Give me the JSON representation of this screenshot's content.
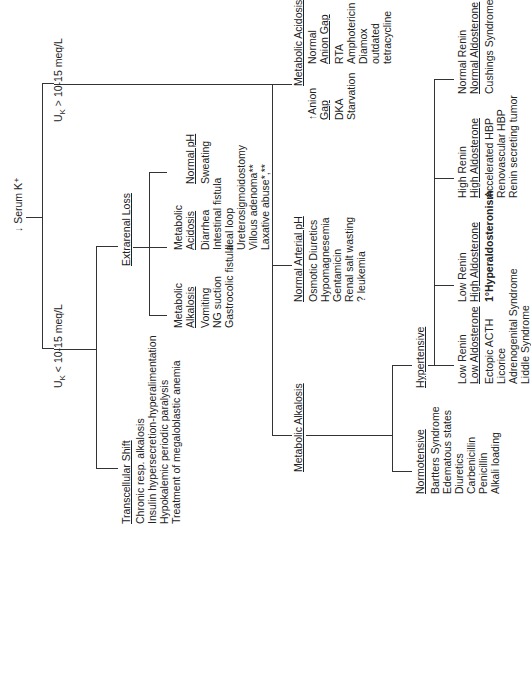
{
  "root": {
    "label": "↓ Serum K⁺"
  },
  "branches": {
    "high": {
      "label_prefix": "U",
      "label_sub": "K",
      "label_rest": " > 10-15 meq/L"
    },
    "low": {
      "label_prefix": "U",
      "label_sub": "K",
      "label_rest": " < 10-15 meq/L"
    }
  },
  "transcellular": {
    "title": "Transcellular Shift",
    "items": [
      "Chronic resp. alkalosis",
      "Insulin hypersecretion-hyperalimentation",
      "Hypokalemic periodic paralysis",
      "Treatment of megaloblastic anemia"
    ]
  },
  "extrarenal": {
    "title": "Extrarenal Loss",
    "alkalosis": {
      "title1": "Metabolic",
      "title2": "Alkalosis",
      "items": [
        "Vomiting",
        "NG suction",
        "Gastrocolic fistula"
      ]
    },
    "acidosis": {
      "title1": "Metabolic",
      "title2": "Acidosis",
      "items": [
        "Diarrhea",
        "Intestinal fistula",
        "Ileal loop",
        "Ureterosigmoidostomy",
        "Villous adenoma**",
        "Laxative abuse*,**"
      ]
    },
    "normal": {
      "title": "Normal pH",
      "items": [
        "Sweating"
      ]
    }
  },
  "renal_acidosis": {
    "title": "Metabolic Acidosis",
    "anion_gap": {
      "title1": "↑Anion",
      "title2": "Gap",
      "items": [
        "DKA",
        "Starvation"
      ]
    },
    "normal_gap": {
      "title1": "Normal",
      "title2": "Anion Gap",
      "items": [
        "RTA",
        "Amphotericin",
        "Diamox",
        "outdated",
        "tetracycline"
      ]
    }
  },
  "renal_normal": {
    "title": "Normal Arterial pH",
    "items": [
      "Osmotic Diuretics",
      "Hypomagnesemia",
      "Gentamicin",
      "Renal salt wasting",
      "? leukemia"
    ]
  },
  "renal_alkalosis": {
    "title": "Metabolic Alkalosis",
    "normotensive": {
      "title": "Normotensive",
      "items": [
        "Bartters Syndrome",
        "Edematous states",
        "Diuretics",
        "Carbenicillin",
        "Penicillin",
        "Alkali loading"
      ]
    },
    "hypertensive": {
      "title": "Hypertensive",
      "groups": [
        {
          "line1": "Low Renin",
          "line2": "Low Aldosterone",
          "items": [
            "Ectopic ACTH",
            "Licorice",
            "Adrenogenital Syndrome",
            "Liddle Syndrome"
          ]
        },
        {
          "line1": "Low Renin",
          "line2": "High Aldosterone",
          "items": [
            "1°Hyperaldosteronism"
          ]
        },
        {
          "line1": "High Renin",
          "line2": "High Aldosterone",
          "items": [
            "Accelerated HBP",
            "Renovascular HBP",
            "Renin secreting tumor"
          ]
        },
        {
          "line1": "Normal Renin",
          "line2": "Normal Aldosterone",
          "items": [
            "Cushings Syndrome"
          ]
        }
      ]
    }
  }
}
